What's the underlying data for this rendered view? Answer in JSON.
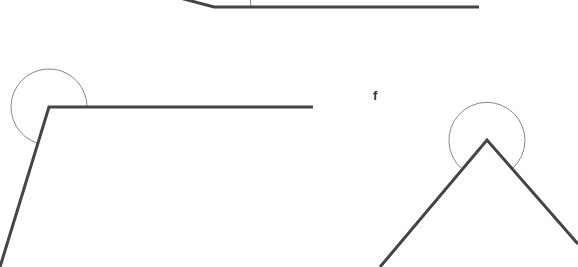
{
  "diagram": {
    "stroke_color": "#444444",
    "arc_color": "#888888",
    "shapes": [
      {
        "name": "top-angle",
        "points": "180,-2 214,7 479,7",
        "arc": {
          "cx": 214,
          "cy": 7,
          "r": 37
        }
      },
      {
        "name": "left-angle",
        "points": "0,267 49,107 313,107",
        "arc": {
          "cx": 49,
          "cy": 107,
          "r": 38
        }
      },
      {
        "name": "right-angle",
        "points": "380,267 487,140 578,244",
        "arc": {
          "cx": 487,
          "cy": 140,
          "r": 38
        }
      }
    ],
    "labels": [
      {
        "text": "f",
        "x": 373,
        "y": 98
      }
    ]
  }
}
